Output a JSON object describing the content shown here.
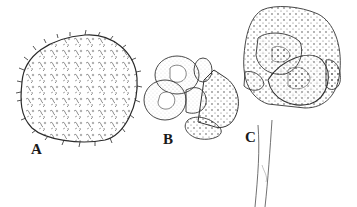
{
  "figure": {
    "panels": [
      {
        "label": "A",
        "subject": "spiny spherical cell"
      },
      {
        "label": "B",
        "subject": "cluster of cells"
      },
      {
        "label": "C",
        "subject": "stalked cell cluster"
      }
    ],
    "colors": {
      "ink": "#2a2a2a",
      "background": "#ffffff"
    }
  }
}
